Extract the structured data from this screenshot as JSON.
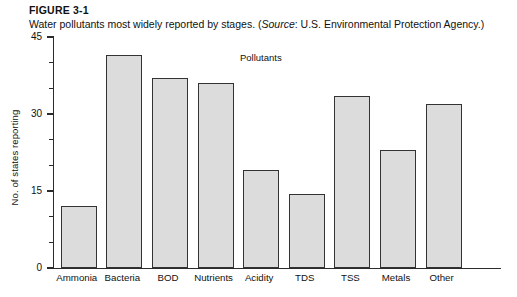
{
  "figure": {
    "label": "FIGURE 3-1",
    "caption_before": "Water pollutants most widely reported by stages. (",
    "caption_source_word": "Source",
    "caption_after": ": U.S. Environmental Protection Agency.)"
  },
  "chart_data": {
    "type": "bar",
    "title": "",
    "annotation": "Pollutants",
    "categories": [
      "Ammonia",
      "Bacteria",
      "BOD",
      "Nutrients",
      "Acidity",
      "TDS",
      "TSS",
      "Metals",
      "Other"
    ],
    "values": [
      12,
      41.5,
      37,
      36,
      19,
      14.5,
      33.5,
      23,
      32
    ],
    "xlabel": "",
    "ylabel": "No. of states reporting",
    "ylim": [
      0,
      45
    ],
    "ytick_labels": [
      "0",
      "15",
      "30",
      "45"
    ],
    "ytick_values": [
      0,
      15,
      30,
      45
    ],
    "yminor_step": 5,
    "grid": false,
    "legend": false,
    "bar_fill_color": "#dcdcdc",
    "bar_edge_color": "#333333",
    "axis_color": "#2b2b2b"
  }
}
